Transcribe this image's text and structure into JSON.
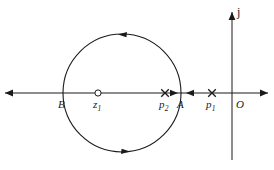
{
  "figure": {
    "width": 274,
    "height": 170,
    "background": "#ffffff",
    "stroke_color": "#1a1a1a",
    "type": "complex-plane-root-locus-diagram"
  },
  "axes": {
    "real": {
      "name": "real-axis",
      "y": 93,
      "x_start": 5,
      "x_end": 268,
      "arrow_left": true,
      "arrow_right": true
    },
    "imaginary": {
      "name": "imaginary-axis",
      "x": 232,
      "y_top": 12,
      "y_bottom": 160,
      "arrow_up": true,
      "label": "j"
    }
  },
  "contour": {
    "name": "circular-contour",
    "center_x": 122,
    "center_y": 93,
    "radius": 59,
    "direction": "counterclockwise",
    "direction_arrows": [
      {
        "name": "contour-arrow-top",
        "x": 124,
        "y": 34,
        "points": "left"
      },
      {
        "name": "contour-arrow-bottom",
        "x": 124,
        "y": 152,
        "points": "right"
      }
    ]
  },
  "points": [
    {
      "id": "B",
      "label": "B",
      "subscript": "",
      "marker": "none",
      "x": 63,
      "y": 93,
      "label_x": 58,
      "label_y": 99,
      "description": "left intersection of contour with real axis"
    },
    {
      "id": "z1",
      "label": "z",
      "subscript": "1",
      "marker": "open-circle",
      "x": 98,
      "y": 93,
      "label_x": 93,
      "label_y": 99,
      "description": "zero on the real axis"
    },
    {
      "id": "p2",
      "label": "p",
      "subscript": "2",
      "marker": "cross",
      "x": 165,
      "y": 93,
      "label_x": 159,
      "label_y": 99,
      "description": "pole inside the contour"
    },
    {
      "id": "A",
      "label": "A",
      "subscript": "",
      "marker": "none",
      "x": 182,
      "y": 93,
      "label_x": 177,
      "label_y": 99,
      "description": "right intersection of contour with real axis"
    },
    {
      "id": "p1",
      "label": "p",
      "subscript": "1",
      "marker": "cross",
      "x": 212,
      "y": 93,
      "label_x": 206,
      "label_y": 99,
      "description": "pole outside the contour"
    },
    {
      "id": "O",
      "label": "O",
      "subscript": "",
      "marker": "none",
      "x": 232,
      "y": 93,
      "label_x": 236,
      "label_y": 99,
      "description": "origin of the complex plane"
    }
  ],
  "axis_arrows": [
    {
      "name": "real-axis-arrow-left-segment",
      "x": 176,
      "points": "right"
    },
    {
      "name": "real-axis-arrow-right-segment",
      "x": 189,
      "points": "left"
    }
  ],
  "imaginary_label": {
    "name": "imaginary-axis-label",
    "text": "j",
    "label_x": 237,
    "label_y": 8
  }
}
